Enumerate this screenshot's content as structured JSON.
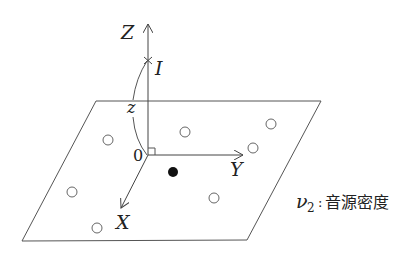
{
  "diagram": {
    "title": "",
    "axes": {
      "z_label": "Z",
      "y_label": "Y",
      "x_label": "X",
      "origin_label": "0"
    },
    "point_label": "I",
    "distance_label": "z",
    "legend": {
      "symbol": "ν",
      "subscript": "2",
      "separator": ":",
      "text": "音源密度"
    },
    "plane": {
      "corners": [
        [
          96,
          101
        ],
        [
          321,
          101
        ],
        [
          247,
          240
        ],
        [
          22,
          241
        ]
      ]
    },
    "sources_open": [
      [
        108,
        140
      ],
      [
        185,
        132
      ],
      [
        271,
        124
      ],
      [
        253,
        148
      ],
      [
        72,
        192
      ],
      [
        214,
        198
      ],
      [
        97,
        228
      ]
    ],
    "source_filled": [
      173,
      172
    ],
    "colors": {
      "line": "#555555",
      "text": "#222222",
      "background": "#ffffff"
    }
  }
}
